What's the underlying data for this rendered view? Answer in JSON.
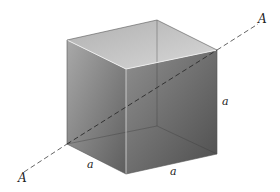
{
  "figure": {
    "axis_labels": {
      "start": "A",
      "end": "A"
    },
    "edge_labels": {
      "height": "a",
      "depth": "a",
      "width": "a"
    },
    "colors": {
      "face_front": "#6f6f6f",
      "face_top": "#b8b8b8",
      "edge_highlight": "#e8e8e8",
      "axis": "#555555"
    }
  }
}
